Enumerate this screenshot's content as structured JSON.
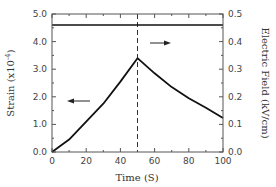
{
  "chart_data": {
    "type": "line",
    "title": "",
    "xlabel": "Time (S)",
    "ylabel_left": "Strain (x10^-4)",
    "ylabel_right": "Electric Field (kV/cm)",
    "xlim": [
      0,
      100
    ],
    "ylim_left": [
      0.0,
      5.0
    ],
    "ylim_right": [
      0.0,
      0.5
    ],
    "x_ticks": [
      "0",
      "20",
      "40",
      "60",
      "80",
      "100"
    ],
    "y_left_ticks": [
      "0.0",
      "1.0",
      "2.0",
      "3.0",
      "4.0",
      "5.0"
    ],
    "y_right_ticks": [
      "0.0",
      "0.1",
      "0.2",
      "0.3",
      "0.4",
      "0.5"
    ],
    "grid": false,
    "legend": "none",
    "series": [
      {
        "name": "Strain",
        "axis": "left",
        "x": [
          0,
          10,
          20,
          30,
          40,
          50,
          60,
          70,
          80,
          90,
          100
        ],
        "values": [
          0.0,
          0.45,
          1.1,
          1.75,
          2.55,
          3.4,
          2.85,
          2.35,
          1.95,
          1.6,
          1.23
        ]
      },
      {
        "name": "Electric Field",
        "axis": "right",
        "x": [
          0,
          100
        ],
        "values": [
          0.46,
          0.46
        ]
      }
    ],
    "annotations": [
      {
        "type": "vline",
        "x": 50,
        "style": "dashed"
      },
      {
        "type": "arrow",
        "direction": "left",
        "meaning": "strain curve uses left axis"
      },
      {
        "type": "arrow",
        "direction": "right",
        "meaning": "electric field line uses right axis"
      }
    ]
  },
  "labels": {
    "xlabel": "Time (S)",
    "ylabel_left_main": "Strain (x10",
    "ylabel_left_sup": "-4",
    "ylabel_left_end": ")",
    "ylabel_right": "Electric Field (kV/cm)"
  }
}
